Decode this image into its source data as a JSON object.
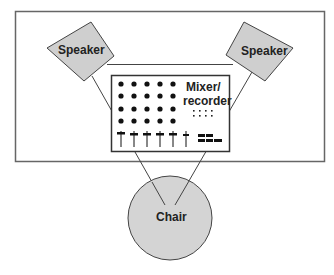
{
  "diagram": {
    "type": "studio-layout",
    "colors": {
      "background": "#ffffff",
      "frame": "#555555",
      "speaker_fill": "#cfcfcf",
      "chair_fill": "#d4d4d4",
      "stroke": "#444444",
      "mixer_fill": "#ffffff",
      "control": "#111111"
    },
    "speakers": [
      {
        "id": "left",
        "label": "Speaker"
      },
      {
        "id": "right",
        "label": "Speaker"
      }
    ],
    "mixer": {
      "label_line1": "Mixer/",
      "label_line2": "recorder",
      "knob_rows": 4,
      "knob_cols": 5,
      "fader_count": 6
    },
    "chair": {
      "label": "Chair"
    }
  }
}
